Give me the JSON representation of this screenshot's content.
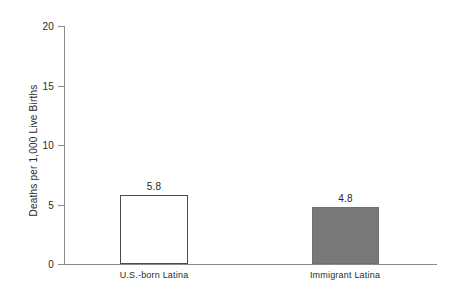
{
  "chart_data": {
    "type": "bar",
    "title": "",
    "subtitle": "",
    "xlabel": "",
    "ylabel": "Deaths per 1,000 Live Births",
    "categories": [
      "U.S.-born Latina",
      "Immigrant Latina"
    ],
    "values": [
      5.8,
      4.8
    ],
    "value_labels": [
      "5.8",
      "4.8"
    ],
    "ylim": [
      0,
      20
    ],
    "yticks": [
      0,
      5,
      10,
      15,
      20
    ],
    "ytick_labels": [
      "0",
      "5",
      "10",
      "15",
      "20"
    ],
    "grid": false,
    "legend": false,
    "legend_position": "none",
    "series": [
      {
        "name": "Infant mortality rate",
        "values": [
          5.8,
          4.8
        ],
        "colors": [
          "#ffffff",
          "#787878"
        ],
        "edge_colors": [
          "#4a4a4a",
          "#6f6f6f"
        ]
      }
    ]
  },
  "axis": {
    "line_color": "#8a8a8a"
  }
}
